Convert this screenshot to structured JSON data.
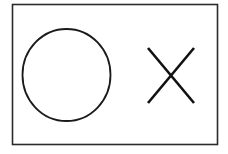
{
  "page": {
    "background_color": "#ffffff",
    "width": 228,
    "height": 154
  },
  "frame": {
    "name": "outer frame",
    "x": 12.5,
    "y": 4.5,
    "width": 205,
    "height": 140,
    "stroke_color": "#2b2b2b",
    "stroke_width": 1.6,
    "fill_color": "#ffffff"
  },
  "shapes": {
    "circle": {
      "label": "O",
      "description": "hand drawn circle outline",
      "cx": 66.5,
      "cy": 75,
      "rx": 44,
      "ry": 46,
      "stroke_color": "#1a1a1a",
      "stroke_width": 1.8,
      "fill": "none"
    },
    "cross": {
      "label": "X",
      "description": "two crossing diagonal strokes",
      "cx": 171,
      "cy": 75.5,
      "stroke_color": "#111111",
      "stroke_width": 2.6,
      "strokes": [
        {
          "name": "stroke-nw-se",
          "x1": 148,
          "y1": 48,
          "x2": 194,
          "y2": 103
        },
        {
          "name": "stroke-ne-sw",
          "x1": 194,
          "y1": 48,
          "x2": 148,
          "y2": 103
        }
      ]
    }
  }
}
